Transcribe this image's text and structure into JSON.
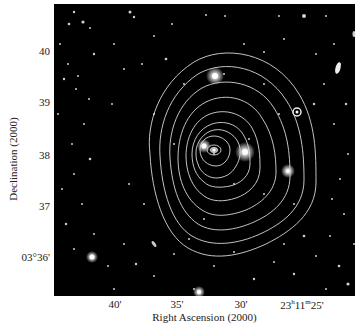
{
  "figure": {
    "x_axis": {
      "title": "Right Ascension (2000)",
      "ticks": [
        {
          "label": "40'",
          "x": 115
        },
        {
          "label": "35'",
          "x": 177
        },
        {
          "label": "30'",
          "x": 241
        },
        {
          "label_parts": {
            "h": "23",
            "h_unit": "h",
            "m": "11",
            "m_unit": "m",
            "s": "25'"
          },
          "x": 302
        }
      ]
    },
    "y_axis": {
      "title": "Declination (2000)",
      "ticks": [
        {
          "label": "40",
          "y": 52
        },
        {
          "label": "39",
          "y": 103
        },
        {
          "label": "38",
          "y": 156
        },
        {
          "label": "37",
          "y": 207
        },
        {
          "label": "03°36'",
          "y": 258
        }
      ]
    },
    "image": {
      "description": "Optical sky image with white contour overlay centered on bright galaxy",
      "background": "#000000",
      "contour_color": "#d8d8d8",
      "contour_levels": 9
    }
  }
}
